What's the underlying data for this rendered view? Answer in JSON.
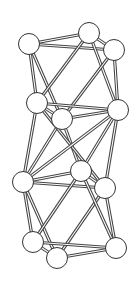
{
  "diagram": {
    "type": "ball-and-stick-graph",
    "style": {
      "background": "#ffffff",
      "edge_outline": "#444444",
      "edge_fill": "#ffffff",
      "node_stroke": "#333333",
      "node_fill": "#ffffff",
      "node_radius": 10.5
    },
    "nodes": [
      {
        "id": "A",
        "x": 29,
        "y": 44
      },
      {
        "id": "B",
        "x": 89,
        "y": 33
      },
      {
        "id": "C",
        "x": 114,
        "y": 50
      },
      {
        "id": "D",
        "x": 37,
        "y": 103
      },
      {
        "id": "E",
        "x": 62,
        "y": 119
      },
      {
        "id": "F",
        "x": 118,
        "y": 110
      },
      {
        "id": "G",
        "x": 81,
        "y": 171
      },
      {
        "id": "H",
        "x": 23,
        "y": 182
      },
      {
        "id": "I",
        "x": 105,
        "y": 188
      },
      {
        "id": "J",
        "x": 33,
        "y": 242
      },
      {
        "id": "K",
        "x": 57,
        "y": 258
      },
      {
        "id": "L",
        "x": 116,
        "y": 248
      }
    ],
    "edges": [
      [
        "A",
        "B"
      ],
      [
        "A",
        "C"
      ],
      [
        "B",
        "C"
      ],
      [
        "A",
        "D"
      ],
      [
        "A",
        "E"
      ],
      [
        "B",
        "D"
      ],
      [
        "B",
        "F"
      ],
      [
        "C",
        "E"
      ],
      [
        "C",
        "F"
      ],
      [
        "D",
        "E"
      ],
      [
        "D",
        "F"
      ],
      [
        "E",
        "F"
      ],
      [
        "D",
        "H"
      ],
      [
        "E",
        "H"
      ],
      [
        "E",
        "G"
      ],
      [
        "D",
        "I"
      ],
      [
        "F",
        "H"
      ],
      [
        "F",
        "G"
      ],
      [
        "F",
        "I"
      ],
      [
        "G",
        "H"
      ],
      [
        "H",
        "I"
      ],
      [
        "G",
        "I"
      ],
      [
        "H",
        "J"
      ],
      [
        "H",
        "K"
      ],
      [
        "G",
        "J"
      ],
      [
        "I",
        "K"
      ],
      [
        "I",
        "L"
      ],
      [
        "G",
        "L"
      ],
      [
        "J",
        "K"
      ],
      [
        "J",
        "L"
      ],
      [
        "K",
        "L"
      ]
    ]
  }
}
